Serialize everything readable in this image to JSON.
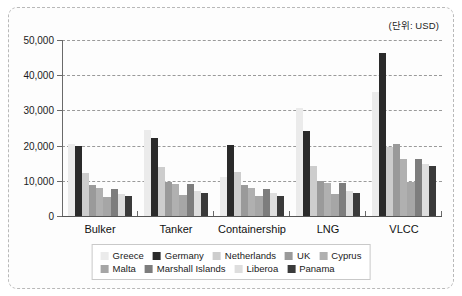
{
  "unit_caption": "(단위: USD)",
  "chart_data": {
    "type": "bar",
    "title": "",
    "subtitle": "",
    "xlabel": "",
    "ylabel": "",
    "unit_note": "(단위: USD)",
    "ylim": [
      0,
      50000
    ],
    "ytick_values": [
      0,
      10000,
      20000,
      30000,
      40000,
      50000
    ],
    "ytick_labels": [
      "0",
      "10,000",
      "20,000",
      "30,000",
      "40,000",
      "50,000"
    ],
    "grid": true,
    "grid_style": "dashed horizontal",
    "legend_position": "bottom-center",
    "categories": [
      "Bulker",
      "Tanker",
      "Containership",
      "LNG",
      "VLCC"
    ],
    "series": [
      {
        "name": "Greece",
        "color": "#ebebeb",
        "values": [
          20500,
          24300,
          11200,
          30600,
          35300
        ]
      },
      {
        "name": "Germany",
        "color": "#2a2a2a",
        "values": [
          20000,
          22200,
          20100,
          24100,
          46300
        ]
      },
      {
        "name": "Netherlands",
        "color": "#cdcdcd",
        "values": [
          12300,
          13800,
          12500,
          14200,
          19500
        ]
      },
      {
        "name": "UK",
        "color": "#9a9a9a",
        "values": [
          8800,
          9700,
          8700,
          9900,
          20500
        ]
      },
      {
        "name": "Cyprus",
        "color": "#b0b0b0",
        "values": [
          8000,
          9000,
          8100,
          9300,
          16100
        ]
      },
      {
        "name": "Malta",
        "color": "#a6a6a6",
        "values": [
          5500,
          6000,
          5800,
          6300,
          9800
        ]
      },
      {
        "name": "Marshall Islands",
        "color": "#7d7d7d",
        "values": [
          7600,
          9200,
          7800,
          9400,
          16200
        ]
      },
      {
        "name": "Liberoa",
        "color": "#dedede",
        "values": [
          6300,
          7000,
          6600,
          7200,
          14900
        ]
      },
      {
        "name": "Panama",
        "color": "#3a3a3a",
        "values": [
          5700,
          6400,
          5800,
          6500,
          14200
        ]
      }
    ],
    "legend_rows": [
      [
        "Greece",
        "Germany",
        "Netherlands",
        "UK",
        "Cyprus"
      ],
      [
        "Malta",
        "Marshall Islands",
        "Liberoa",
        "Panama"
      ]
    ]
  }
}
